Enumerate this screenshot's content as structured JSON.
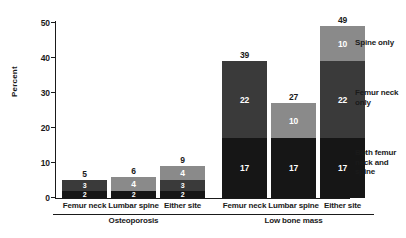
{
  "chart_data": {
    "type": "bar",
    "subtype": "stacked-bar-grouped",
    "title": "",
    "xlabel": "",
    "ylabel": "Percent",
    "ylim": [
      0,
      50
    ],
    "yticks": [
      0,
      10,
      20,
      30,
      40,
      50
    ],
    "ytick_labels": [
      "0",
      "10",
      "20",
      "30",
      "40",
      "50"
    ],
    "grid": false,
    "legend_position": "right",
    "categories": [
      "Femur neck",
      "Lumbar spine",
      "Either site",
      "Femur neck",
      "Lumbar spine",
      "Either site"
    ],
    "groups": [
      {
        "label": "Osteoporosis",
        "categories": [
          "Femur neck",
          "Lumbar spine",
          "Either site"
        ]
      },
      {
        "label": "Low bone mass",
        "categories": [
          "Femur neck",
          "Lumbar spine",
          "Either site"
        ]
      }
    ],
    "series": [
      {
        "name": "Both femur neck and spine",
        "color": "#161616",
        "values": [
          2,
          2,
          2,
          17,
          17,
          17
        ]
      },
      {
        "name": "Femur neck only",
        "color": "#3a3a3a",
        "values": [
          3,
          0,
          3,
          22,
          0,
          22
        ]
      },
      {
        "name": "Spine only",
        "color": "#8a8a8a",
        "values": [
          0,
          4,
          4,
          0,
          10,
          10
        ]
      }
    ],
    "totals": [
      5,
      6,
      9,
      39,
      27,
      49
    ]
  },
  "axis": {
    "y_title": "Percent",
    "ticks": [
      {
        "value": 50,
        "label": "50"
      },
      {
        "value": 40,
        "label": "40"
      },
      {
        "value": 30,
        "label": "30"
      },
      {
        "value": 20,
        "label": "20"
      },
      {
        "value": 10,
        "label": "10"
      },
      {
        "value": 0,
        "label": "0"
      }
    ]
  },
  "bars": [
    {
      "category": "Femur neck",
      "group": "Osteoporosis",
      "total": "5",
      "segments": [
        {
          "series": "Spine only",
          "value": "",
          "raw": 0
        },
        {
          "series": "Femur neck only",
          "value": "3",
          "raw": 3
        },
        {
          "series": "Both femur neck and spine",
          "value": "2",
          "raw": 2
        }
      ]
    },
    {
      "category": "Lumbar spine",
      "group": "Osteoporosis",
      "total": "6",
      "segments": [
        {
          "series": "Spine only",
          "value": "4",
          "raw": 4
        },
        {
          "series": "Femur neck only",
          "value": "",
          "raw": 0
        },
        {
          "series": "Both femur neck and spine",
          "value": "2",
          "raw": 2
        }
      ]
    },
    {
      "category": "Either site",
      "group": "Osteoporosis",
      "total": "9",
      "segments": [
        {
          "series": "Spine only",
          "value": "4",
          "raw": 4
        },
        {
          "series": "Femur neck only",
          "value": "3",
          "raw": 3
        },
        {
          "series": "Both femur neck and spine",
          "value": "2",
          "raw": 2
        }
      ]
    },
    {
      "category": "Femur neck",
      "group": "Low bone mass",
      "total": "39",
      "segments": [
        {
          "series": "Spine only",
          "value": "",
          "raw": 0
        },
        {
          "series": "Femur neck only",
          "value": "22",
          "raw": 22
        },
        {
          "series": "Both femur neck and spine",
          "value": "17",
          "raw": 17
        }
      ]
    },
    {
      "category": "Lumbar spine",
      "group": "Low bone mass",
      "total": "27",
      "segments": [
        {
          "series": "Spine only",
          "value": "10",
          "raw": 10
        },
        {
          "series": "Femur neck only",
          "value": "",
          "raw": 0
        },
        {
          "series": "Both femur neck and spine",
          "value": "17",
          "raw": 17
        }
      ]
    },
    {
      "category": "Either site",
      "group": "Low bone mass",
      "total": "49",
      "segments": [
        {
          "series": "Spine only",
          "value": "10",
          "raw": 10
        },
        {
          "series": "Femur neck only",
          "value": "22",
          "raw": 22
        },
        {
          "series": "Both femur neck and spine",
          "value": "17",
          "raw": 17
        }
      ]
    }
  ],
  "group_labels": [
    {
      "label": "Osteoporosis"
    },
    {
      "label": "Low bone mass"
    }
  ],
  "legend": [
    {
      "label": "Spine only",
      "color": "#8a8a8a"
    },
    {
      "label": "Femur neck\nonly",
      "color": "#3a3a3a"
    },
    {
      "label": "Both femur\nneck and\nspine",
      "color": "#161616"
    }
  ],
  "colors": {
    "spine_only": "#8a8a8a",
    "femur_neck_only": "#3a3a3a",
    "both": "#161616",
    "axis": "#1a1a1a",
    "background": "#ffffff"
  }
}
